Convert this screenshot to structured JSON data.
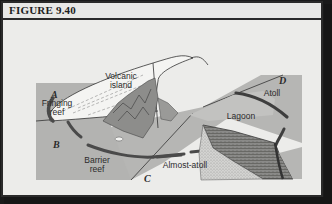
{
  "figure": {
    "title": "FIGURE 9.40"
  },
  "labels": {
    "volcanic_island_line1": "Volcanic",
    "volcanic_island_line2": "island",
    "fringing_line1": "Fringing",
    "fringing_line2": "reef",
    "barrier_line1": "Barrier",
    "barrier_line2": "reef",
    "almost_atoll": "Almost-atoll",
    "atoll": "Atoll",
    "lagoon": "Lagoon"
  },
  "stages": {
    "a": "A",
    "b": "B",
    "c": "C",
    "d": "D"
  },
  "colors": {
    "page": "#ececea",
    "sea": "#b3b3b1",
    "island": "#f2f2f0",
    "reef": "#505050",
    "border": "#2a2a2a"
  }
}
